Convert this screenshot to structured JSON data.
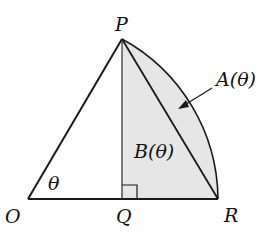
{
  "diagram": {
    "points": {
      "O": {
        "label": "O",
        "x": 28,
        "y": 199
      },
      "P": {
        "label": "P",
        "x": 122,
        "y": 39
      },
      "Q": {
        "label": "Q",
        "x": 122,
        "y": 199
      },
      "R": {
        "label": "R",
        "x": 218,
        "y": 199
      }
    },
    "angle_label": "θ",
    "region_labels": {
      "A": "A(θ)",
      "B": "B(θ)"
    },
    "colors": {
      "line": "#1a1a1a",
      "shade": "#e6e6e6"
    }
  }
}
